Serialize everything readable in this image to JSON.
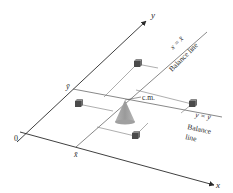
{
  "diagram": {
    "axes": {
      "x_label": "x",
      "y_label": "y",
      "origin_label": "0"
    },
    "mean_labels": {
      "x_bar": "x̄",
      "y_bar": "ȳ"
    },
    "center_of_mass_label": "c.m.",
    "balance_lines": [
      {
        "equation": "x = x̄",
        "caption": "Balance line"
      },
      {
        "equation": "y = ȳ",
        "caption_line1": "Balance",
        "caption_line2": "line"
      }
    ],
    "masses": [
      {
        "name": "top"
      },
      {
        "name": "left"
      },
      {
        "name": "right"
      },
      {
        "name": "bottom"
      }
    ],
    "colors": {
      "line": "#3a3a3a",
      "cone": "#a8a8a8",
      "cube_dark": "#4a4a4a",
      "cube_light": "#8a8a8a"
    }
  }
}
